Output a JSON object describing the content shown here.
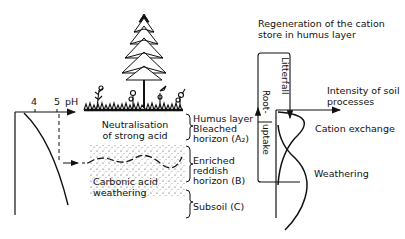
{
  "ph_axis": {
    "ticks": [
      "4",
      "5"
    ],
    "unit": "pH"
  },
  "profile": {
    "zone_upper_label": "Neutralisation\nof strong acid",
    "zone_upper_line1": "Neutralisation",
    "zone_upper_line2": "of strong acid",
    "zone_lower_line1": "Carbonic acid",
    "zone_lower_line2": "weathering"
  },
  "horizons": [
    {
      "line1": "Humus layer",
      "line2": "",
      "line3": ""
    },
    {
      "line1": "Bleached",
      "line2": "horizon (A₂)",
      "line3": ""
    },
    {
      "line1": "Enriched",
      "line2": "reddish",
      "line3": "horizon (B)"
    },
    {
      "line1": "Subsoil (C)",
      "line2": "",
      "line3": ""
    }
  ],
  "right_panel": {
    "title_line1": "Regeneration of the cation",
    "title_line2": "store in humus layer",
    "litterfall": "Litterfall",
    "root_line1": "Root-",
    "root_line2": "uptake",
    "axis_label_line1": "Intensity of soil",
    "axis_label_line2": "processes",
    "curve1_label": "Cation exchange",
    "curve2_label": "Weathering"
  }
}
